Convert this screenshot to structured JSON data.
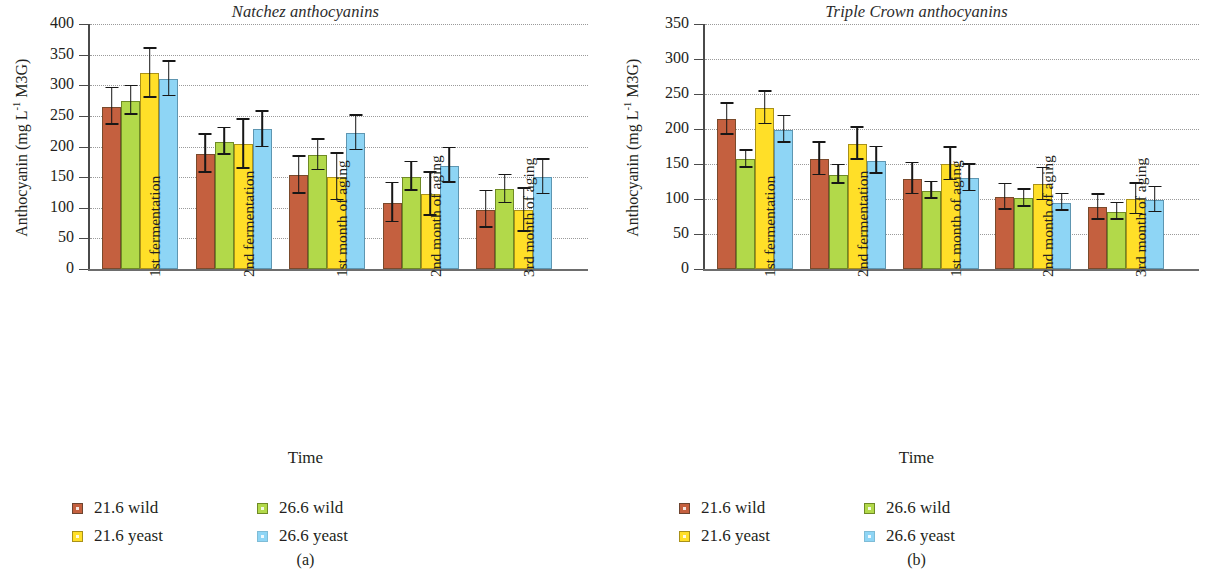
{
  "figure": {
    "ylabel_text": "Anthocyanin (mg L",
    "ylabel_sup": "-1",
    "ylabel_tail": " M3G)",
    "xlabel": "Time"
  },
  "panel_a": {
    "title": "Natchez anthocyanins",
    "subcaption": "(a)"
  },
  "panel_b": {
    "title": "Triple Crown anthocyanins",
    "subcaption": "(b)"
  },
  "legend": {
    "items": [
      {
        "label": "21.6 wild",
        "color": "#c4603f",
        "key": "c0"
      },
      {
        "label": "26.6 wild",
        "color": "#b2d94a",
        "key": "c1"
      },
      {
        "label": "21.6 yeast",
        "color": "#ffdf28",
        "key": "c2"
      },
      {
        "label": "26.6 yeast",
        "color": "#8ed5f5",
        "key": "c3"
      }
    ]
  },
  "chart_data": [
    {
      "type": "bar",
      "title": "Natchez anthocyanins",
      "panel": "(a)",
      "xlabel": "Time",
      "ylabel": "Anthocyanin (mg L-1 M3G)",
      "ylim": [
        0,
        400
      ],
      "yticks": [
        0,
        50,
        100,
        150,
        200,
        250,
        300,
        350,
        400
      ],
      "grid": "dotted-horizontal",
      "legend_position": "below",
      "categories": [
        "1st fermentation",
        "2nd fermentation",
        "1st month of aging",
        "2nd month of aging",
        "3rd month of aging"
      ],
      "series": [
        {
          "name": "21.6 wild",
          "color": "#c4603f",
          "values": [
            265,
            188,
            153,
            108,
            97
          ],
          "errors": [
            30,
            31,
            30,
            32,
            30
          ]
        },
        {
          "name": "26.6 wild",
          "color": "#b2d94a",
          "values": [
            275,
            208,
            186,
            151,
            130
          ],
          "errors": [
            23,
            22,
            25,
            23,
            23
          ]
        },
        {
          "name": "21.6 yeast",
          "color": "#ffdf28",
          "values": [
            320,
            204,
            150,
            122,
            96
          ],
          "errors": [
            40,
            40,
            38,
            35,
            35
          ]
        },
        {
          "name": "26.6 yeast",
          "color": "#8ed5f5",
          "values": [
            310,
            228,
            222,
            169,
            150
          ],
          "errors": [
            28,
            29,
            28,
            28,
            28
          ]
        }
      ]
    },
    {
      "type": "bar",
      "title": "Triple Crown anthocyanins",
      "panel": "(b)",
      "xlabel": "Time",
      "ylabel": "Anthocyanin (mg L-1 M3G)",
      "ylim": [
        0,
        350
      ],
      "yticks": [
        0,
        50,
        100,
        150,
        200,
        250,
        300,
        350
      ],
      "grid": "dotted-horizontal",
      "legend_position": "below",
      "categories": [
        "1st fermentation",
        "2nd fermentation",
        "1st month of aging",
        "2nd month of aging",
        "3rd month of aging"
      ],
      "series": [
        {
          "name": "21.6 wild",
          "color": "#c4603f",
          "values": [
            214,
            157,
            129,
            103,
            88
          ],
          "errors": [
            22,
            23,
            22,
            18,
            18
          ]
        },
        {
          "name": "26.6 wild",
          "color": "#b2d94a",
          "values": [
            157,
            135,
            112,
            101,
            82
          ],
          "errors": [
            12,
            13,
            12,
            12,
            12
          ]
        },
        {
          "name": "21.6 yeast",
          "color": "#ffdf28",
          "values": [
            230,
            179,
            150,
            121,
            100
          ],
          "errors": [
            23,
            23,
            23,
            23,
            22
          ]
        },
        {
          "name": "26.6 yeast",
          "color": "#8ed5f5",
          "values": [
            199,
            155,
            130,
            95,
            99
          ],
          "errors": [
            19,
            19,
            19,
            12,
            18
          ]
        }
      ]
    }
  ]
}
